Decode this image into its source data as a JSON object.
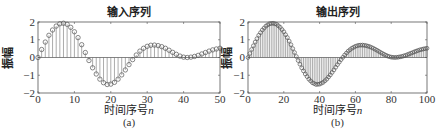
{
  "chart_data": [
    {
      "id": "a",
      "type": "stem",
      "title": "输入序列",
      "xlabel": "时间序号n",
      "ylabel": "振幅",
      "caption": "(a)",
      "xlim": [
        0,
        50
      ],
      "ylim": [
        -2,
        2
      ],
      "xticks": [
        0,
        10,
        20,
        30,
        40,
        50
      ],
      "yticks": [
        -2,
        -1,
        0,
        1,
        2
      ],
      "grid": false,
      "marker": "open-circle",
      "x": [
        0,
        1,
        2,
        3,
        4,
        5,
        6,
        7,
        8,
        9,
        10,
        11,
        12,
        13,
        14,
        15,
        16,
        17,
        18,
        19,
        20,
        21,
        22,
        23,
        24,
        25,
        26,
        27,
        28,
        29,
        30,
        31,
        32,
        33,
        34,
        35,
        36,
        37,
        38,
        39,
        40,
        41,
        42,
        43,
        44,
        45,
        46,
        47,
        48,
        49,
        50
      ],
      "values": [
        0,
        0.45,
        0.87,
        1.25,
        1.55,
        1.77,
        1.9,
        1.93,
        1.87,
        1.7,
        1.45,
        1.12,
        0.72,
        0.28,
        -0.17,
        -0.58,
        -0.93,
        -1.22,
        -1.42,
        -1.52,
        -1.5,
        -1.4,
        -1.22,
        -0.98,
        -0.7,
        -0.4,
        -0.12,
        0.14,
        0.36,
        0.52,
        0.63,
        0.69,
        0.7,
        0.67,
        0.61,
        0.52,
        0.41,
        0.29,
        0.18,
        0.08,
        0.02,
        0,
        0.02,
        0.06,
        0.12,
        0.2,
        0.28,
        0.36,
        0.43,
        0.48,
        0.52
      ]
    },
    {
      "id": "b",
      "type": "stem",
      "title": "输出序列",
      "xlabel": "时间序号n",
      "ylabel": "振幅",
      "caption": "(b)",
      "xlim": [
        0,
        100
      ],
      "ylim": [
        -2,
        2
      ],
      "xticks": [
        0,
        20,
        40,
        60,
        80,
        100
      ],
      "yticks": [
        -2,
        -1,
        0,
        1,
        2
      ],
      "grid": false,
      "marker": "open-circle",
      "x_range": [
        0,
        100
      ],
      "values_note": "input sequence interpolated by factor 2 (sample n of output = input at n/2)"
    }
  ],
  "colors": {
    "axis": "#555555",
    "stem": "#666666",
    "marker": "#555555",
    "background": "#ffffff"
  }
}
